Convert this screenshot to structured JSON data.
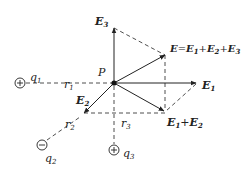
{
  "diagram": {
    "colors": {
      "line": "#222222",
      "background": "#ffffff"
    },
    "point": {
      "label": "P"
    },
    "charges": [
      {
        "name": "q",
        "sub": "1",
        "sign": "+"
      },
      {
        "name": "q",
        "sub": "2",
        "sign": "−"
      },
      {
        "name": "q",
        "sub": "3",
        "sign": "+"
      }
    ],
    "distances": [
      {
        "name": "r",
        "sub": "1"
      },
      {
        "name": "r",
        "sub": "2"
      },
      {
        "name": "r",
        "sub": "3"
      }
    ],
    "vectors": {
      "e1": {
        "name": "E",
        "sub": "1"
      },
      "e2": {
        "name": "E",
        "sub": "2"
      },
      "e3": {
        "name": "E",
        "sub": "3"
      },
      "e12": {
        "a": "E",
        "a_sub": "1",
        "plus": "+",
        "b": "E",
        "b_sub": "2"
      },
      "total": {
        "name": "E",
        "eq": "=",
        "a": "E",
        "a_sub": "1",
        "plus1": "+",
        "b": "E",
        "b_sub": "2",
        "plus2": "+",
        "c": "E",
        "c_sub": "3"
      }
    }
  }
}
